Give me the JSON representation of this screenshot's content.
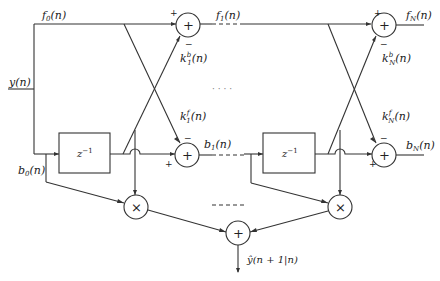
{
  "diagram": {
    "type": "lattice predictor block diagram",
    "input": "y(n)",
    "output": "ŷ(n + 1|n)",
    "forward_signals": {
      "f0": "f",
      "f0_sub": "0",
      "f1": "f",
      "f1_sub": "1",
      "fN": "f",
      "fN_sub": "N",
      "arg": "(n)"
    },
    "backward_signals": {
      "b0": "b",
      "b0_sub": "0",
      "b1": "b",
      "b1_sub": "1",
      "bN": "b",
      "bN_sub": "N",
      "arg": "(n)"
    },
    "coefficients": {
      "k1b": {
        "base": "k",
        "sup": "b",
        "sub": "1",
        "arg": "(n)"
      },
      "k1f": {
        "base": "k",
        "sup": "f",
        "sub": "1",
        "arg": "(n)"
      },
      "kNb": {
        "base": "k",
        "sup": "b",
        "sub": "N",
        "arg": "(n)"
      },
      "kNf": {
        "base": "k",
        "sup": "f",
        "sub": "N",
        "arg": "(n)"
      }
    },
    "delay_label": "z",
    "delay_exp": "−1",
    "adder_symbol": "+",
    "multiplier_symbol": "×",
    "plus_sign": "+",
    "minus_sign": "−",
    "ellipsis": "· · · ·"
  }
}
